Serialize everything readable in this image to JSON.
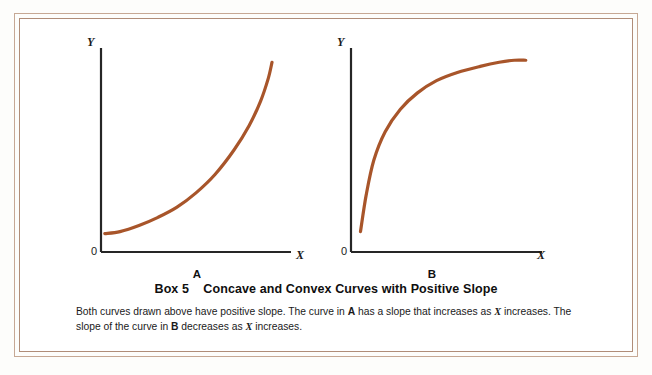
{
  "figure": {
    "frame_color_outer": "#c6a894",
    "frame_color_inner": "#b08d78",
    "background": "#ffffff"
  },
  "caption": {
    "box_label": "Box 5",
    "title": "Concave and Convex Curves with Positive Slope",
    "title_full": "Box 5    Concave and Convex Curves with Positive Slope",
    "line1_part1": "Both curves drawn above have positive slope. The curve in ",
    "line1_bold_a": "A",
    "line1_part2": " has a slope that increases as ",
    "line1_ital_x": "X",
    "line1_part3": " increases.",
    "line2_part1": "The slope of the curve in ",
    "line2_bold_b": "B",
    "line2_part2": " decreases as ",
    "line2_ital_x": "X",
    "line2_part3": " increases."
  },
  "chart_data": [
    {
      "type": "line",
      "title": "A",
      "panel_letter": "A",
      "xlabel": "X",
      "ylabel": "Y",
      "origin_label": "0",
      "curve_color": "#a8552a",
      "curve_width": 3.2,
      "grid": false,
      "legend": null,
      "description": "Convex curve with positive slope; slope increases as X increases",
      "xlim": [
        0,
        100
      ],
      "ylim": [
        0,
        100
      ],
      "x": [
        2,
        10,
        20,
        30,
        40,
        50,
        60,
        70,
        78,
        84,
        88,
        90
      ],
      "y": [
        9,
        10,
        13,
        17,
        22,
        29,
        38,
        50,
        62,
        74,
        85,
        93
      ]
    },
    {
      "type": "line",
      "title": "B",
      "panel_letter": "B",
      "xlabel": "X",
      "ylabel": "Y",
      "origin_label": "0",
      "curve_color": "#a8552a",
      "curve_width": 3.2,
      "grid": false,
      "legend": null,
      "description": "Concave curve with positive slope; slope decreases as X increases",
      "xlim": [
        0,
        100
      ],
      "ylim": [
        0,
        100
      ],
      "x": [
        5,
        8,
        12,
        18,
        26,
        35,
        45,
        56,
        68,
        78,
        86,
        92
      ],
      "y": [
        10,
        28,
        45,
        59,
        70,
        78,
        84,
        88,
        91,
        93,
        94,
        94
      ]
    }
  ]
}
